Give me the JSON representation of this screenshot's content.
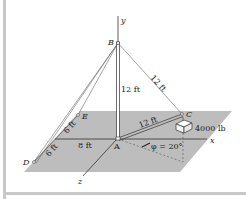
{
  "diagram": {
    "axes": {
      "x": "x",
      "y": "y",
      "z": "z"
    },
    "points": {
      "A": "A",
      "B": "B",
      "C": "C",
      "D": "D",
      "E": "E"
    },
    "dimensions": {
      "AB": "12 ft",
      "BC": "12 ft",
      "AC": "12 ft",
      "DE_upper": "6 ft",
      "DE_lower": "6 ft",
      "A_to_DE": "8 ft"
    },
    "load": "4000 lb",
    "angle": "φ = 20°",
    "colors": {
      "plane": "#bdbdbd",
      "frame": "#c8c8c8",
      "line": "#333333"
    }
  }
}
